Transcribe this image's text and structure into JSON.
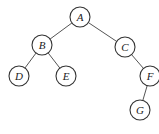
{
  "diagram": {
    "type": "binary-tree",
    "nodes": [
      {
        "id": "A",
        "label": "A",
        "x": 80,
        "y": 17
      },
      {
        "id": "B",
        "label": "B",
        "x": 42,
        "y": 45
      },
      {
        "id": "C",
        "label": "C",
        "x": 125,
        "y": 47
      },
      {
        "id": "D",
        "label": "D",
        "x": 19,
        "y": 76
      },
      {
        "id": "E",
        "label": "E",
        "x": 66,
        "y": 76
      },
      {
        "id": "F",
        "label": "F",
        "x": 150,
        "y": 76
      },
      {
        "id": "G",
        "label": "G",
        "x": 140,
        "y": 110
      }
    ],
    "edges": [
      {
        "from": "A",
        "to": "B"
      },
      {
        "from": "A",
        "to": "C"
      },
      {
        "from": "B",
        "to": "D"
      },
      {
        "from": "B",
        "to": "E"
      },
      {
        "from": "C",
        "to": "F"
      },
      {
        "from": "F",
        "to": "G"
      }
    ],
    "node_radius": 10
  }
}
